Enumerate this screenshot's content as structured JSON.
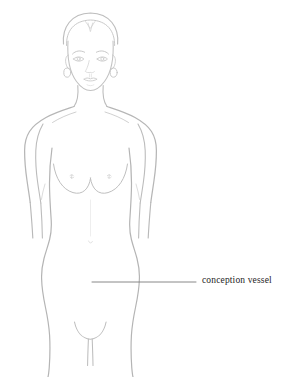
{
  "figure": {
    "kind": "anatomical-line-drawing",
    "background_color": "#ffffff",
    "outline_color": "#b6b6b6",
    "outline_color_soft": "#c9c9c9",
    "detail_color": "#cfcfcf",
    "leader_line_color": "#7a7a7a",
    "label_color": "#1d1d1d",
    "title_cropped": ""
  },
  "annotations": [
    {
      "id": "conception-vessel",
      "label": "conception vessel",
      "leader_line": {
        "x1": 92,
        "y1": 282,
        "x2": 196,
        "y2": 282
      },
      "label_position": {
        "x": 202,
        "y": 275
      }
    }
  ],
  "parts": [
    {
      "name": "hair",
      "visible": true
    },
    {
      "name": "face",
      "visible": true
    },
    {
      "name": "eyes",
      "visible": true
    },
    {
      "name": "eyebrows",
      "visible": true
    },
    {
      "name": "nose",
      "visible": true
    },
    {
      "name": "lips",
      "visible": true
    },
    {
      "name": "earrings",
      "visible": true
    },
    {
      "name": "neck",
      "visible": true
    },
    {
      "name": "clavicle",
      "visible": true
    },
    {
      "name": "shoulders",
      "visible": true
    },
    {
      "name": "arms",
      "visible": true
    },
    {
      "name": "breasts",
      "visible": true
    },
    {
      "name": "torso",
      "visible": true
    },
    {
      "name": "hips",
      "visible": true
    },
    {
      "name": "groin",
      "visible": true
    },
    {
      "name": "legs",
      "visible": true
    }
  ]
}
